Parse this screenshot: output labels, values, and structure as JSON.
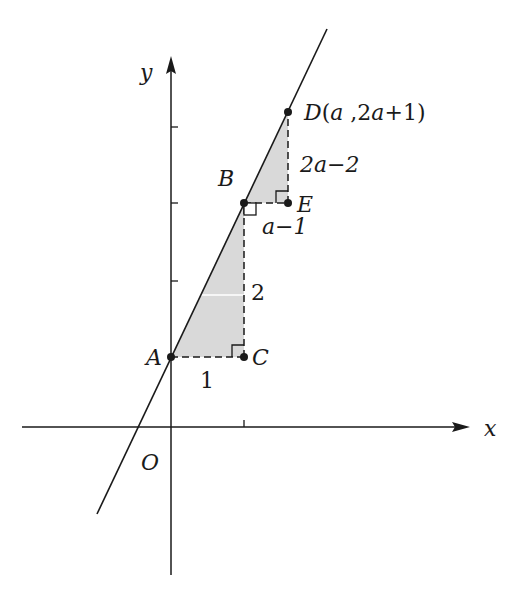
{
  "figure": {
    "axes": {
      "x_label": "x",
      "y_label": "y",
      "origin_label": "O"
    },
    "points": {
      "A": {
        "label": "A"
      },
      "B": {
        "label": "B"
      },
      "C": {
        "label": "C"
      },
      "D": {
        "label": "D",
        "coord_label": "(a ,2a+1)",
        "coord_text": "D(a ,2a+1)"
      },
      "E": {
        "label": "E"
      }
    },
    "segment_labels": {
      "AC": "1",
      "BC": "2",
      "BE": "a−1",
      "DE": "2a−2"
    },
    "colors": {
      "line": "#1a1a1a",
      "shade": "#d9d9d9",
      "background": "#ffffff"
    }
  }
}
